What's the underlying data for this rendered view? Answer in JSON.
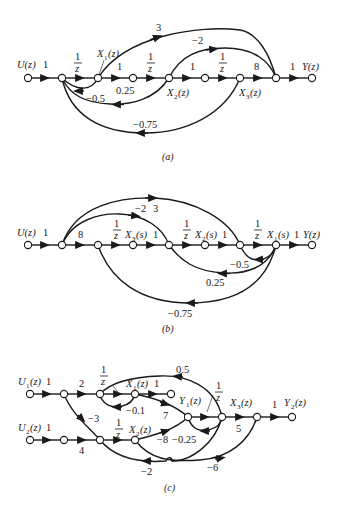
{
  "figure": {
    "panels": [
      {
        "id": "a",
        "caption": "(a)",
        "input_label": "U(z)",
        "output_label": "Y(z)",
        "state_labels": {
          "x1": "X1(z)",
          "x2": "X2(z)",
          "x3": "X3(z)"
        },
        "forward_gains": [
          "1",
          "1/z",
          "1",
          "1/z",
          "1",
          "1/z",
          "8",
          "1"
        ],
        "branches": [
          {
            "from": "X1",
            "to": "pre-Y",
            "gain": "3"
          },
          {
            "from": "X2",
            "to": "pre-Y",
            "gain": "-2"
          },
          {
            "from": "X1",
            "to": "n1",
            "gain": "-0.5"
          },
          {
            "from": "X2",
            "to": "n1",
            "gain": "0.25"
          },
          {
            "from": "X3",
            "to": "n1",
            "gain": "-0.75"
          }
        ]
      },
      {
        "id": "b",
        "caption": "(b)",
        "input_label": "U(z)",
        "output_label": "Y(z)",
        "state_labels": {
          "x1": "X1(s)",
          "x2": "X2(s)",
          "x3": "X3(s)"
        },
        "forward_gains": [
          "1",
          "8",
          "1/z",
          "1",
          "1/z",
          "1",
          "1/z",
          "1"
        ],
        "branches": [
          {
            "from": "n1",
            "to": "n6",
            "gain": "3"
          },
          {
            "from": "n1",
            "to": "n4",
            "gain": "-2"
          },
          {
            "from": "X1",
            "to": "n6",
            "gain": "-0.5"
          },
          {
            "from": "X1",
            "to": "n4",
            "gain": "0.25"
          },
          {
            "from": "X1",
            "to": "n2",
            "gain": "-0.75"
          }
        ]
      },
      {
        "id": "c",
        "caption": "(c)",
        "inputs": [
          "U1(z)",
          "U2(z)"
        ],
        "outputs": [
          "Y1(z)",
          "Y2(z)"
        ],
        "state_labels": {
          "x1": "X1(z)",
          "x2": "X2(z)",
          "x3": "X3(z)"
        },
        "gains": {
          "u1_in": "1",
          "u2_in": "1",
          "top_2": "2",
          "top_1z": "1/z",
          "x1_y1": "1",
          "cross_neg3": "-3",
          "bottom_4": "4",
          "bottom_1z": "1/z",
          "self_neg01": "-0.1",
          "x1_to_mid_7": "7",
          "mid_1z": "1/z",
          "x3_5": "5",
          "y2_1": "1",
          "fb_05": "0.5",
          "fb_neg025": "-0.25",
          "x2_neg8": "-8",
          "x2_neg6": "-6",
          "fb_neg2": "-2"
        }
      }
    ]
  },
  "text": {
    "one": "1",
    "z": "z",
    "three": "3",
    "neg2": "−2",
    "neg05": "−0.5",
    "p025": "0.25",
    "neg075": "−0.75",
    "eight": "8",
    "U": "U(z)",
    "Y": "Y(z)",
    "X1z": "X",
    "X2z": "X",
    "X3z": "X",
    "sub1": "1",
    "sub2": "2",
    "sub3": "3",
    "argz": "(z)",
    "args": "(s)",
    "U1": "U",
    "U2": "U",
    "Y1": "Y",
    "Y2": "Y",
    "c_neg3": "−3",
    "c_4": "4",
    "c_2": "2",
    "c_7": "7",
    "c_5": "5",
    "c_neg01": "−0.1",
    "c_05": "0.5",
    "c_neg025": "−0.25",
    "c_neg8": "−8",
    "c_neg6": "−6",
    "c_neg2": "−2",
    "cap_a": "(a)",
    "cap_b": "(b)",
    "cap_c": "(c)"
  }
}
